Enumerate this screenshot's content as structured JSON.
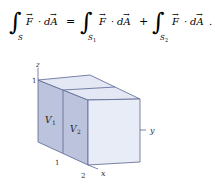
{
  "equation": {
    "lhs_domain": "S",
    "rhs1_domain": "S",
    "rhs1_sub": "1",
    "rhs2_domain": "S",
    "rhs2_sub": "2",
    "field": "F",
    "differential": "dA",
    "equals": "=",
    "plus": "+",
    "dot": "·",
    "end": "."
  },
  "figure": {
    "axis_z": "z",
    "axis_y": "y",
    "axis_x": "x",
    "tick_z_1": "1",
    "tick_x_1": "1",
    "tick_x_2": "2",
    "region_1": "V",
    "region_1_sub": "1",
    "region_2": "V",
    "region_2_sub": "2",
    "colors": {
      "left_face": "#bcc3dc",
      "top_face": "#e3e8f4",
      "front_face": "#e8ecf6",
      "edge": "#5a6490"
    }
  }
}
